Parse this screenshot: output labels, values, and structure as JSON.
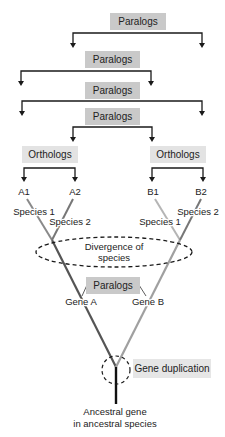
{
  "diagram": {
    "colors": {
      "paralogs_box": "#c9c9c9",
      "orthologs_box": "#e3e3e3",
      "duplication_box": "#e6e6e6",
      "bracket_line": "#1a1a1a",
      "gene_a_branch": "#555555",
      "gene_b_branch": "#a0a0a0",
      "species1_branch": "#8a8a8a",
      "species2_branch": "#777777",
      "trunk": "#111111"
    },
    "brackets": [
      {
        "label": "Paralogs",
        "type": "paralogs"
      },
      {
        "label": "Paralogs",
        "type": "paralogs"
      },
      {
        "label": "Paralogs",
        "type": "paralogs"
      },
      {
        "label": "Paralogs",
        "type": "paralogs"
      },
      {
        "label": "Orthologs",
        "type": "orthologs"
      },
      {
        "label": "Orthologs",
        "type": "orthologs"
      }
    ],
    "leaves": {
      "a1": "A1",
      "a2": "A2",
      "b1": "B1",
      "b2": "B2"
    },
    "species_labels": {
      "a_species1": "Species 1",
      "a_species2": "Species 2",
      "b_species1": "Species 1",
      "b_species2": "Species 2"
    },
    "divergence": {
      "line1": "Divergence of",
      "line2": "species"
    },
    "gene_paralogs_label": "Paralogs",
    "genes": {
      "gene_a": "Gene A",
      "gene_b": "Gene B"
    },
    "duplication_label": "Gene duplication",
    "ancestral": {
      "line1": "Ancestral gene",
      "line2": "in ancestral species"
    }
  }
}
